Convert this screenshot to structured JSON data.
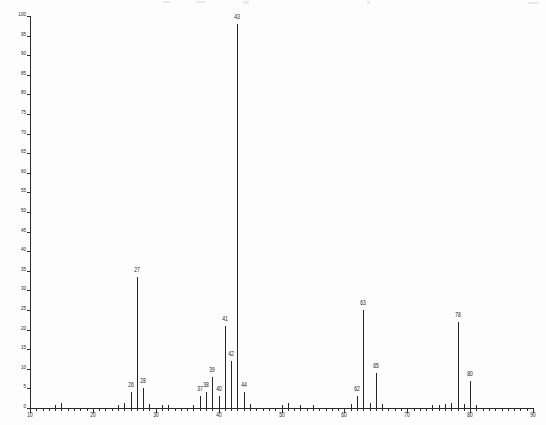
{
  "chart_data": {
    "type": "bar",
    "title": "",
    "subtitle": "",
    "xlabel": "",
    "ylabel": "",
    "xlim": [
      10,
      90
    ],
    "ylim": [
      0,
      100
    ],
    "x_tick_interval": 1,
    "x_major_tick_interval": 10,
    "y_tick_interval": 5,
    "x_tick_labels": [
      "10",
      "20",
      "30",
      "40",
      "50",
      "60",
      "70",
      "80",
      "90"
    ],
    "y_tick_labels": [
      "0",
      "5",
      "10",
      "15",
      "20",
      "25",
      "30",
      "35",
      "40",
      "45",
      "50",
      "55",
      "60",
      "65",
      "70",
      "75",
      "80",
      "85",
      "90",
      "95",
      "100"
    ],
    "grid": false,
    "legend": "none",
    "series_name": "relative abundance",
    "categories": [
      14,
      15,
      24,
      25,
      26,
      27,
      28,
      29,
      31,
      32,
      36,
      37,
      38,
      39,
      40,
      41,
      42,
      43,
      44,
      45,
      50,
      51,
      53,
      55,
      61,
      62,
      63,
      64,
      65,
      66,
      74,
      75,
      76,
      77,
      78,
      79,
      80,
      81
    ],
    "values": [
      0.8,
      1.2,
      0.8,
      1.2,
      4.0,
      33.5,
      5.0,
      1.0,
      0.8,
      0.8,
      0.8,
      3.0,
      4.0,
      8.0,
      3.0,
      21.0,
      12.0,
      98.0,
      4.0,
      1.0,
      0.8,
      1.2,
      0.8,
      0.8,
      1.0,
      3.0,
      25.0,
      1.2,
      9.0,
      1.0,
      0.8,
      0.8,
      1.0,
      1.2,
      22.0,
      1.0,
      7.0,
      0.8
    ],
    "labeled_peaks": [
      {
        "mz": 26,
        "intensity": 4.0,
        "label": "26"
      },
      {
        "mz": 27,
        "intensity": 33.5,
        "label": "27"
      },
      {
        "mz": 28,
        "intensity": 5.0,
        "label": "28"
      },
      {
        "mz": 37,
        "intensity": 3.0,
        "label": "37"
      },
      {
        "mz": 38,
        "intensity": 4.0,
        "label": "38"
      },
      {
        "mz": 39,
        "intensity": 8.0,
        "label": "39"
      },
      {
        "mz": 40,
        "intensity": 3.0,
        "label": "40"
      },
      {
        "mz": 41,
        "intensity": 21.0,
        "label": "41"
      },
      {
        "mz": 42,
        "intensity": 12.0,
        "label": "42"
      },
      {
        "mz": 43,
        "intensity": 98.0,
        "label": "43"
      },
      {
        "mz": 44,
        "intensity": 4.0,
        "label": "44"
      },
      {
        "mz": 62,
        "intensity": 3.0,
        "label": "62"
      },
      {
        "mz": 63,
        "intensity": 25.0,
        "label": "63"
      },
      {
        "mz": 65,
        "intensity": 9.0,
        "label": "65"
      },
      {
        "mz": 78,
        "intensity": 22.0,
        "label": "78"
      },
      {
        "mz": 80,
        "intensity": 7.0,
        "label": "80"
      }
    ]
  },
  "geometry": {
    "plot_left": 30,
    "plot_right": 533,
    "plot_baseline": 408,
    "plot_top": 16
  },
  "colors": {
    "ink": "#262626",
    "axis": "#2b2b2b",
    "background": "#fdfdfd"
  }
}
